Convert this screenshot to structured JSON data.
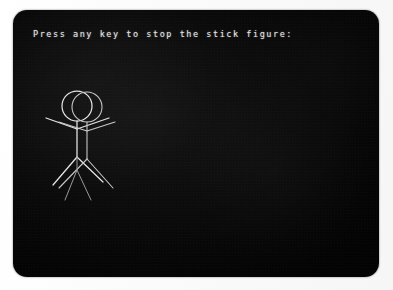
{
  "screen": {
    "background_color": "#0d0d0d",
    "foreground_color": "#e8e8e8",
    "corner_radius_px": 14
  },
  "terminal": {
    "prompt_text": "Press any key to stop the stick figure:",
    "cursor_visible": false
  },
  "figure": {
    "name": "stick-figure",
    "stroke_color": "#e6e6e6",
    "frames": [
      {
        "label": "frame-a",
        "head": {
          "cx": 64,
          "cy": 96,
          "r": 15
        },
        "torso": {
          "x1": 64,
          "y1": 111,
          "x2": 64,
          "y2": 147
        },
        "arm_left": {
          "x1": 64,
          "y1": 119,
          "x2": 33,
          "y2": 108
        },
        "arm_right": {
          "x1": 64,
          "y1": 119,
          "x2": 96,
          "y2": 108
        },
        "leg_left": {
          "x1": 64,
          "y1": 147,
          "x2": 40,
          "y2": 175
        },
        "leg_right": {
          "x1": 64,
          "y1": 147,
          "x2": 90,
          "y2": 172
        }
      },
      {
        "label": "frame-b",
        "head": {
          "cx": 74,
          "cy": 97,
          "r": 15
        },
        "torso": {
          "x1": 74,
          "y1": 112,
          "x2": 74,
          "y2": 149
        },
        "arm_left": {
          "x1": 74,
          "y1": 121,
          "x2": 46,
          "y2": 112
        },
        "arm_right": {
          "x1": 74,
          "y1": 121,
          "x2": 102,
          "y2": 112
        },
        "leg_left": {
          "x1": 74,
          "y1": 149,
          "x2": 46,
          "y2": 178
        },
        "leg_right": {
          "x1": 74,
          "y1": 149,
          "x2": 100,
          "y2": 178
        }
      },
      {
        "label": "frame-c",
        "torso": {
          "x1": 64,
          "y1": 122,
          "x2": 64,
          "y2": 160
        },
        "leg_left": {
          "x1": 64,
          "y1": 160,
          "x2": 52,
          "y2": 190
        },
        "leg_right": {
          "x1": 64,
          "y1": 160,
          "x2": 78,
          "y2": 190
        }
      }
    ]
  }
}
